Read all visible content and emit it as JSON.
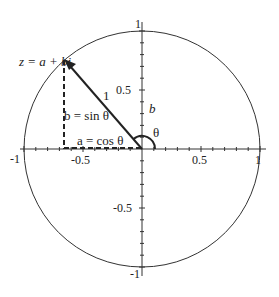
{
  "diagram": {
    "point_label": "z = a + bi",
    "radius_label": "1",
    "vertical_label": "b = sin θ",
    "horizontal_label": "a = cos θ",
    "axis_label_b": "b",
    "angle_label": "θ",
    "angle_label_left": "θ",
    "x_ticks": [
      "-1",
      "-0.5",
      "0.5",
      "1"
    ],
    "y_ticks": [
      "1",
      "0.5",
      "-0.5",
      "-1"
    ],
    "colors": {
      "stroke": "#222222",
      "background": "#ffffff"
    }
  }
}
